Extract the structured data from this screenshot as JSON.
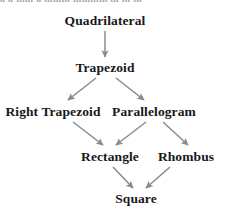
{
  "page": {
    "background_color": "#ffffff",
    "text_color": "#18181a",
    "arrow_color": "#8a8a8c",
    "clipped_top_line": "a a mm a mmm mmmm m m m"
  },
  "diagram": {
    "type": "hierarchy",
    "nodes": [
      {
        "id": "quadrilateral",
        "label": "Quadrilateral",
        "level": 0
      },
      {
        "id": "trapezoid",
        "label": "Trapezoid",
        "level": 1
      },
      {
        "id": "right_trapezoid",
        "label": "Right Trapezoid",
        "level": 2
      },
      {
        "id": "parallelogram",
        "label": "Parallelogram",
        "level": 2
      },
      {
        "id": "rectangle",
        "label": "Rectangle",
        "level": 3
      },
      {
        "id": "rhombus",
        "label": "Rhombus",
        "level": 3
      },
      {
        "id": "square",
        "label": "Square",
        "level": 4
      }
    ],
    "edges": [
      {
        "from": "quadrilateral",
        "to": "trapezoid"
      },
      {
        "from": "trapezoid",
        "to": "right_trapezoid"
      },
      {
        "from": "trapezoid",
        "to": "parallelogram"
      },
      {
        "from": "right_trapezoid",
        "to": "rectangle"
      },
      {
        "from": "parallelogram",
        "to": "rectangle"
      },
      {
        "from": "parallelogram",
        "to": "rhombus"
      },
      {
        "from": "rectangle",
        "to": "square"
      },
      {
        "from": "rhombus",
        "to": "square"
      }
    ]
  }
}
